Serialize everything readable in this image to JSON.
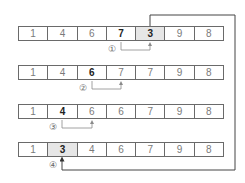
{
  "diagram": {
    "rows": [
      {
        "cells": [
          "1",
          "4",
          "6",
          "7",
          "3",
          "9",
          "8"
        ],
        "bold": [
          3,
          4
        ],
        "shaded": [
          4
        ],
        "step": "①"
      },
      {
        "cells": [
          "1",
          "4",
          "6",
          "7",
          "7",
          "9",
          "8"
        ],
        "bold": [
          2
        ],
        "shaded": [],
        "step": "②"
      },
      {
        "cells": [
          "1",
          "4",
          "6",
          "6",
          "7",
          "9",
          "8"
        ],
        "bold": [
          1
        ],
        "shaded": [],
        "step": "③"
      },
      {
        "cells": [
          "1",
          "3",
          "4",
          "6",
          "7",
          "9",
          "8"
        ],
        "bold": [
          1
        ],
        "shaded": [
          1
        ],
        "step": "④"
      }
    ],
    "colors": {
      "border": "#6a6a6a",
      "arrow_gray": "#8a8a8a",
      "arrow_dark": "#333333",
      "shade": "#e6e6e6"
    }
  }
}
